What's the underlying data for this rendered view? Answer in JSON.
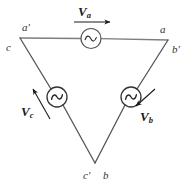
{
  "figure": {
    "type": "delta-connected-three-phase-source-schematic",
    "background_color": "#ffffff",
    "line_color": "#7d7d7d",
    "dark_line_color": "#4a4a4a",
    "label_color": "#333333",
    "arrow_color": "#1a1a1a"
  },
  "nodes": [
    {
      "id": "a-prime",
      "label": "a'",
      "x": 22,
      "y": 22
    },
    {
      "id": "c-top",
      "label": "c",
      "x": 6,
      "y": 42
    },
    {
      "id": "a-right",
      "label": "a",
      "x": 160,
      "y": 24
    },
    {
      "id": "b-prime",
      "label": "b'",
      "x": 172,
      "y": 44
    },
    {
      "id": "c-prime",
      "label": "c'",
      "x": 83,
      "y": 170
    },
    {
      "id": "b-bottom",
      "label": "b",
      "x": 103,
      "y": 170
    }
  ],
  "sources": [
    {
      "id": "source-a",
      "symbol": "ac-sine",
      "cx": 91,
      "cy": 38
    },
    {
      "id": "source-c",
      "symbol": "ac-sine",
      "cx": 57,
      "cy": 97
    },
    {
      "id": "source-b",
      "symbol": "ac-sine",
      "cx": 131,
      "cy": 97
    }
  ],
  "voltages": [
    {
      "id": "Va",
      "symbol": "V",
      "subscript": "a",
      "label_x": 78,
      "label_y": 5,
      "arrow_direction": "right"
    },
    {
      "id": "Vb",
      "symbol": "V",
      "subscript": "b",
      "label_x": 140,
      "label_y": 110,
      "arrow_direction": "down-left"
    },
    {
      "id": "Vc",
      "symbol": "V",
      "subscript": "c",
      "label_x": 21,
      "label_y": 105,
      "arrow_direction": "up-left"
    }
  ],
  "edges": [
    {
      "id": "edge-a",
      "from": "a-prime-c",
      "to": "a-b-prime",
      "note": "top horizontal branch containing source a"
    },
    {
      "id": "edge-b",
      "from": "a-b-prime",
      "to": "c-prime-b",
      "note": "right descending branch containing source b"
    },
    {
      "id": "edge-c",
      "from": "a-prime-c",
      "to": "c-prime-b",
      "note": "left descending branch containing source c"
    }
  ]
}
